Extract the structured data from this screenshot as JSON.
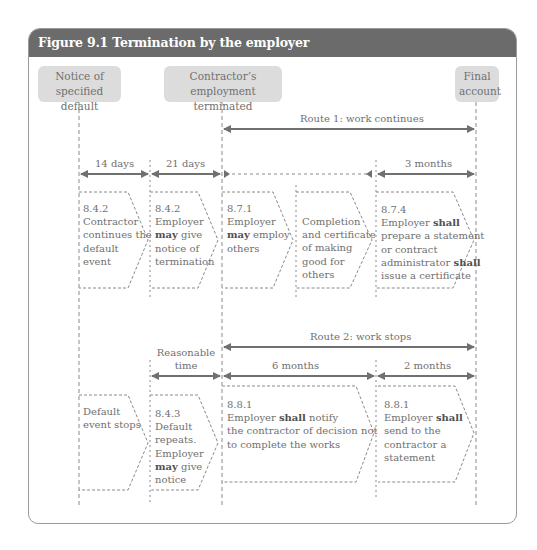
{
  "figure": {
    "title": "Figure 9.1  Termination by the employer",
    "header_color": "#6b6b6b",
    "milestone_fill": "#dcdcdc"
  },
  "milestones": [
    {
      "id": "notice",
      "line1": "Notice of",
      "line2": "specified default"
    },
    {
      "id": "terminated",
      "line1": "Contractor’s employment",
      "line2": "terminated"
    },
    {
      "id": "final",
      "line1": "Final",
      "line2": "account"
    }
  ],
  "route1": {
    "label": "Route 1: work continues",
    "periods": [
      {
        "label": "14 days"
      },
      {
        "label": "21 days"
      },
      {
        "label": "3 months"
      }
    ],
    "boxes": [
      {
        "clause": "8.4.2",
        "lines": [
          "Contractor",
          "continues the",
          "default",
          "event"
        ]
      },
      {
        "clause": "8.4.2",
        "pre": "Employer",
        "bold": "may",
        "post": "give",
        "lines": [
          "notice of",
          "termination"
        ]
      },
      {
        "clause": "8.7.1",
        "pre": "Employer",
        "bold": "may",
        "post": "employ",
        "lines": [
          "others"
        ]
      },
      {
        "clause": "",
        "lines": [
          "Completion",
          "and certificate",
          "of making",
          "good for",
          "others"
        ]
      },
      {
        "clause": "8.7.4",
        "l1_pre": "Employer ",
        "l1_bold": "shall",
        "l2": "prepare a statement",
        "l3": "or contract",
        "l4_pre": "administrator ",
        "l4_bold": "shall",
        "l5": "issue a certificate"
      }
    ]
  },
  "route2": {
    "label": "Route 2: work stops",
    "periods": [
      {
        "label_line1": "Reasonable",
        "label_line2": "time"
      },
      {
        "label": "6 months"
      },
      {
        "label": "2 months"
      }
    ],
    "boxes": [
      {
        "clause": "",
        "lines": [
          "Default",
          "event stops"
        ]
      },
      {
        "clause": "8.4.3",
        "lines": [
          "Default",
          "repeats.",
          "Employer"
        ],
        "bold": "may",
        "post": "give",
        "last": "notice"
      },
      {
        "clause": "8.8.1",
        "pre": "Employer ",
        "bold": "shall",
        "post": " notify",
        "lines": [
          "the contractor of decision not",
          "to complete the works"
        ]
      },
      {
        "clause": "8.8.1",
        "pre": "Employer ",
        "bold": "shall",
        "lines": [
          "send to the",
          "contractor a",
          "statement"
        ]
      }
    ]
  }
}
